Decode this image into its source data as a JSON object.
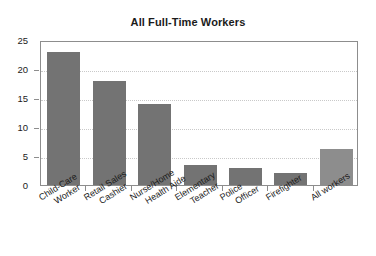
{
  "chart_data": {
    "type": "bar",
    "title": "All Full-Time Workers",
    "xlabel": "",
    "ylabel": "",
    "ylim": [
      0,
      25
    ],
    "yticks": [
      "0",
      "5",
      "10",
      "15",
      "20",
      "25"
    ],
    "grid": "horizontal-dotted",
    "legend": "none",
    "categories": [
      "Child-Care Worker",
      "Retail Sales Cashier",
      "Nurse/Home Health Aide",
      "Elementary Teacher",
      "Police Officer",
      "Firefighter",
      "All workers"
    ],
    "values": [
      23,
      18,
      14,
      3.4,
      3,
      2,
      6.2
    ],
    "bar_colors": [
      "#737373",
      "#737373",
      "#737373",
      "#737373",
      "#737373",
      "#737373",
      "#8d8d8d"
    ]
  },
  "colors": {
    "bar_dark": "#737373",
    "bar_light": "#8d8d8d",
    "frame": "#8d8d8d",
    "gridline": "#c9c9c9",
    "text": "#1b1b1b",
    "background": "#ffffff"
  },
  "axis": {
    "y_tick_values": [
      0,
      5,
      10,
      15,
      20,
      25
    ]
  },
  "category_labels": [
    {
      "line1": "Child-Care",
      "line2": "Worker"
    },
    {
      "line1": "Retail Sales",
      "line2": "Cashier"
    },
    {
      "line1": "Nurse/Home",
      "line2": "Health Aide"
    },
    {
      "line1": "Elementary",
      "line2": "Teacher"
    },
    {
      "line1": "Police",
      "line2": "Officer"
    },
    {
      "line1": "Firefighter",
      "line2": ""
    },
    {
      "line1": "All workers",
      "line2": ""
    }
  ]
}
